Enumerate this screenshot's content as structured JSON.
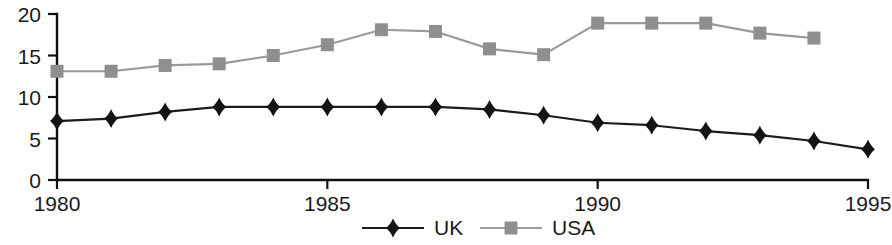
{
  "chart_data": {
    "type": "line",
    "title": "",
    "subtitle": "",
    "xlabel": "",
    "ylabel": "",
    "xlim": [
      1980,
      1995
    ],
    "ylim": [
      0,
      20
    ],
    "grid": false,
    "legend_position": "bottom",
    "x_tick_labels": [
      "1980",
      "1985",
      "1990",
      "1995"
    ],
    "x_tick_values": [
      1980,
      1985,
      1990,
      1995
    ],
    "y_tick_labels": [
      "0",
      "5",
      "10",
      "15",
      "20"
    ],
    "y_tick_values": [
      0,
      5,
      10,
      15,
      20
    ],
    "x": [
      1980,
      1981,
      1982,
      1983,
      1984,
      1985,
      1986,
      1987,
      1988,
      1989,
      1990,
      1991,
      1992,
      1993,
      1994,
      1995
    ],
    "series": [
      {
        "name": "UK",
        "color": "#141414",
        "marker": "diamond",
        "x": [
          1980,
          1981,
          1982,
          1983,
          1984,
          1985,
          1986,
          1987,
          1988,
          1989,
          1990,
          1991,
          1992,
          1993,
          1994,
          1995
        ],
        "values": [
          7.1,
          7.4,
          8.2,
          8.8,
          8.8,
          8.8,
          8.8,
          8.8,
          8.5,
          7.8,
          6.9,
          6.6,
          5.9,
          5.4,
          4.7,
          3.7
        ]
      },
      {
        "name": "USA",
        "color": "#8f8f8f",
        "marker": "square",
        "x": [
          1980,
          1981,
          1982,
          1983,
          1984,
          1985,
          1986,
          1987,
          1988,
          1989,
          1990,
          1991,
          1992,
          1993,
          1994
        ],
        "values": [
          13.1,
          13.1,
          13.8,
          14.0,
          15.0,
          16.3,
          18.1,
          17.9,
          15.8,
          15.1,
          18.9,
          18.9,
          18.9,
          17.7,
          17.1
        ]
      }
    ]
  },
  "legend": {
    "items": [
      {
        "label": "UK",
        "color": "#141414",
        "marker": "diamond"
      },
      {
        "label": "USA",
        "color": "#8f8f8f",
        "marker": "square"
      }
    ]
  },
  "colors": {
    "uk": "#141414",
    "usa": "#8f8f8f",
    "axis": "#111111",
    "background": "#ffffff"
  }
}
